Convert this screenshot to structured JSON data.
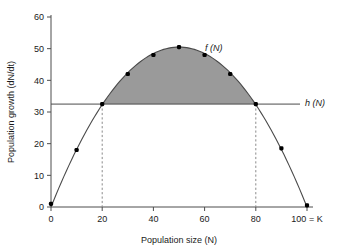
{
  "chart_data": {
    "type": "line",
    "title": "",
    "xlabel": "Population size (N)",
    "ylabel": "Population growth (dN/dt)",
    "xlim": [
      0,
      100
    ],
    "ylim": [
      0,
      60
    ],
    "grid": false,
    "legend_position": "inline-right",
    "x_ticks": [
      "0",
      "20",
      "40",
      "60",
      "80",
      "100 = K"
    ],
    "x_tick_values": [
      0,
      20,
      40,
      60,
      80,
      100
    ],
    "y_ticks": [
      "0",
      "10",
      "20",
      "30",
      "40",
      "50",
      "60"
    ],
    "y_tick_values": [
      0,
      10,
      20,
      30,
      40,
      50,
      60
    ],
    "series": [
      {
        "name": "f (N)",
        "type": "line-with-markers",
        "label": "f (N)",
        "x": [
          0,
          10,
          20,
          30,
          40,
          50,
          60,
          70,
          80,
          90,
          100
        ],
        "values": [
          1,
          18,
          32.5,
          42,
          48,
          50.5,
          48,
          42,
          32.5,
          18.5,
          0.5
        ],
        "color": "#4a4a4a"
      },
      {
        "name": "h (N)",
        "type": "horizontal-line",
        "label": "h (N)",
        "y_value": 32.5,
        "color": "#4a4a4a"
      }
    ],
    "shaded_region": {
      "description": "area between f (N) and h (N)",
      "x_start": 20,
      "x_end": 80,
      "color": "#9a9a9a"
    },
    "dropline_x_values": [
      20,
      80
    ],
    "annotations": [
      {
        "text": "f (N)",
        "x": 63,
        "y": 46
      },
      {
        "text": "h (N)",
        "x": 104,
        "y": 32.5
      }
    ]
  },
  "labels": {
    "x_axis_title": "Population size (N)",
    "y_axis_title": "Population growth (dN/dt)",
    "curve_label": "f (N)",
    "harvest_label": "h (N)",
    "x_tick_0": "0",
    "x_tick_20": "20",
    "x_tick_40": "40",
    "x_tick_60": "60",
    "x_tick_80": "80",
    "x_tick_100": "100 = K",
    "y_tick_0": "0",
    "y_tick_10": "10",
    "y_tick_20": "20",
    "y_tick_30": "30",
    "y_tick_40": "40",
    "y_tick_50": "50",
    "y_tick_60": "60"
  }
}
